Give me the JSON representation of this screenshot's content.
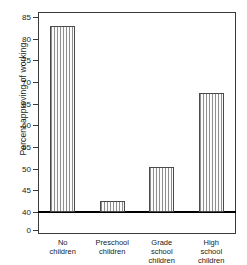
{
  "chart_data": {
    "type": "bar",
    "title": "",
    "subtitle": "",
    "xlabel": "",
    "ylabel": "Percent approving of working",
    "categories": [
      "No children",
      "Preschool children",
      "Grade school children",
      "High school children"
    ],
    "category_lines": [
      [
        "No",
        "children"
      ],
      [
        "Preschool",
        "children"
      ],
      [
        "Grade",
        "school",
        "children"
      ],
      [
        "High",
        "school",
        "children"
      ]
    ],
    "values": [
      83,
      42.5,
      50.5,
      67.5
    ],
    "ylim": [
      40,
      85
    ],
    "yticks": [
      40,
      45,
      50,
      55,
      60,
      65,
      70,
      75,
      80,
      85
    ],
    "ytick_labels": [
      "40",
      "45",
      "50",
      "55",
      "60",
      "65",
      "70",
      "75",
      "80",
      "85"
    ],
    "axis_break": true,
    "axis_break_label": "0",
    "grid": false,
    "legend": null,
    "bar_fill": "vertical-stripe-hatch",
    "bar_edge_color": "#4a4a4a",
    "baseline_color": "#000000",
    "frame_color": "#3a3a3a",
    "background_color": "#ffffff"
  }
}
